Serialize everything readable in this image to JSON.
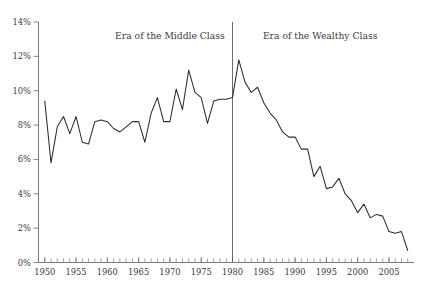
{
  "chart_data": {
    "type": "line",
    "title": "",
    "xlabel": "",
    "ylabel": "",
    "xlim": [
      1949,
      2009
    ],
    "ylim": [
      0,
      14
    ],
    "grid": false,
    "legend_position": "none",
    "y_tick_labels": [
      "0%",
      "2%",
      "4%",
      "6%",
      "8%",
      "10%",
      "12%",
      "14%"
    ],
    "y_tick_values": [
      0,
      2,
      4,
      6,
      8,
      10,
      12,
      14
    ],
    "x_tick_labels": [
      "1950",
      "1955",
      "1960",
      "1965",
      "1970",
      "1975",
      "1980",
      "1985",
      "1990",
      "1995",
      "2000",
      "2005"
    ],
    "x_tick_values": [
      1950,
      1955,
      1960,
      1965,
      1970,
      1975,
      1980,
      1985,
      1990,
      1995,
      2000,
      2005
    ],
    "x_minor_tick_step": 1,
    "series": [
      {
        "name": "value",
        "color": "#2d2d2d",
        "x": [
          1950,
          1951,
          1952,
          1953,
          1954,
          1955,
          1956,
          1957,
          1958,
          1959,
          1960,
          1961,
          1962,
          1963,
          1964,
          1965,
          1966,
          1967,
          1968,
          1969,
          1970,
          1971,
          1972,
          1973,
          1974,
          1975,
          1976,
          1977,
          1978,
          1979,
          1980,
          1981,
          1982,
          1983,
          1984,
          1985,
          1986,
          1987,
          1988,
          1989,
          1990,
          1991,
          1992,
          1993,
          1994,
          1995,
          1996,
          1997,
          1998,
          1999,
          2000,
          2001,
          2002,
          2003,
          2004,
          2005,
          2006,
          2007,
          2008
        ],
        "values": [
          9.4,
          5.8,
          7.9,
          8.5,
          7.5,
          8.5,
          7.0,
          6.9,
          8.2,
          8.3,
          8.2,
          7.8,
          7.6,
          7.9,
          8.2,
          8.2,
          7.0,
          8.7,
          9.6,
          8.2,
          8.2,
          10.1,
          8.9,
          11.2,
          9.9,
          9.6,
          8.1,
          9.4,
          9.5,
          9.5,
          9.6,
          11.8,
          10.5,
          9.9,
          10.2,
          9.3,
          8.7,
          8.3,
          7.6,
          7.3,
          7.3,
          6.6,
          6.6,
          5.0,
          5.6,
          4.3,
          4.4,
          4.9,
          4.0,
          3.6,
          2.9,
          3.4,
          2.6,
          2.8,
          2.7,
          1.8,
          1.7,
          1.8,
          0.7
        ]
      }
    ],
    "annotations": [
      {
        "name": "era-middle-class",
        "text": "Era of the Middle Class",
        "x_center": 1970,
        "y": 13.0
      },
      {
        "name": "era-wealthy-class",
        "text": "Era of the Wealthy Class",
        "x_center": 1994,
        "y": 13.0
      }
    ],
    "divider": {
      "name": "era-divider",
      "x": 1980,
      "label": "1980"
    }
  }
}
